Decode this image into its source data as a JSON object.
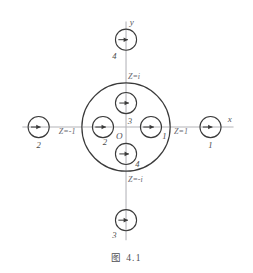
{
  "figure": {
    "caption": "图 4.1",
    "top_bleed_text": "",
    "background_color": "#ffffff",
    "stroke_color": "#3a3a3a",
    "axis_color": "#b3b3b8"
  },
  "axes": {
    "x_label": "x",
    "y_label": "y",
    "origin_label": "O"
  },
  "unit_circle": {
    "label": "unit-circle",
    "center": {
      "x": 126,
      "y": 124
    },
    "radius": 46
  },
  "boundary_markers": [
    {
      "name": "marker-z-eq-i",
      "text": "Z=i",
      "position": "top",
      "x": 128,
      "y": 74
    },
    {
      "name": "marker-z-eq-minus-i",
      "text": "Z=-i",
      "position": "bottom",
      "x": 128,
      "y": 181
    },
    {
      "name": "marker-z-eq-minus-1",
      "text": "Z=-1",
      "position": "left",
      "x": 56,
      "y": 131
    },
    {
      "name": "marker-z-eq-1",
      "text": "Z=1",
      "position": "right",
      "x": 176,
      "y": 131
    }
  ],
  "nodes": [
    {
      "name": "node-outer-right",
      "label": "1",
      "cx": 214,
      "cy": 124,
      "r": 11,
      "label_x": 214,
      "label_y": 146
    },
    {
      "name": "node-outer-left",
      "label": "2",
      "cx": 35,
      "cy": 124,
      "r": 11,
      "label_x": 35,
      "label_y": 146
    },
    {
      "name": "node-outer-bottom",
      "label": "3",
      "cx": 126,
      "cy": 221,
      "r": 11,
      "label_x": 114,
      "label_y": 240
    },
    {
      "name": "node-outer-top",
      "label": "4",
      "cx": 126,
      "cy": 33,
      "r": 11,
      "label_x": 114,
      "label_y": 53
    },
    {
      "name": "node-inner-right",
      "label": "1",
      "cx": 152,
      "cy": 124,
      "r": 11,
      "label_x": 166,
      "label_y": 136
    },
    {
      "name": "node-inner-left",
      "label": "2",
      "cx": 102,
      "cy": 124,
      "r": 11,
      "label_x": 104,
      "label_y": 143
    },
    {
      "name": "node-inner-top",
      "label": "3",
      "cx": 126,
      "cy": 99,
      "r": 11,
      "label_x": 130,
      "label_y": 121
    },
    {
      "name": "node-inner-bottom",
      "label": "4",
      "cx": 126,
      "cy": 152,
      "r": 11,
      "label_x": 138,
      "label_y": 166
    }
  ]
}
